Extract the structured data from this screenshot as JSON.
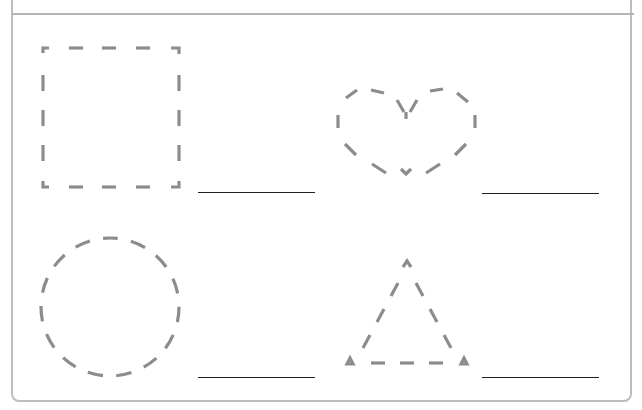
{
  "worksheet": {
    "header_text": "",
    "style": {
      "dash_color": "#8c8c8c",
      "frame_color": "#bdbdbd",
      "answer_line_color": "#222222"
    },
    "items": [
      {
        "shape": "square",
        "answer": ""
      },
      {
        "shape": "heart",
        "answer": ""
      },
      {
        "shape": "circle",
        "answer": ""
      },
      {
        "shape": "triangle",
        "answer": ""
      }
    ]
  }
}
